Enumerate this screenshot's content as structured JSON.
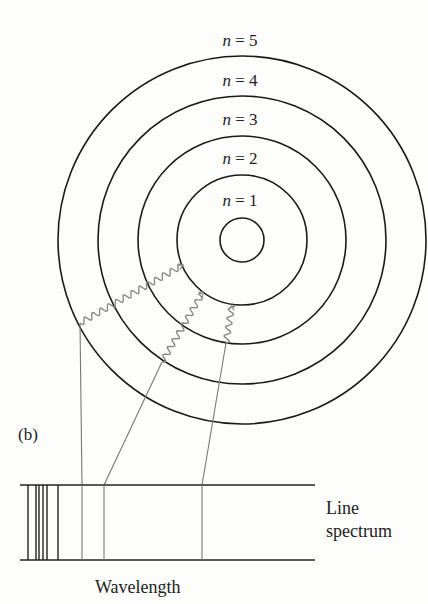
{
  "figure": {
    "panel_label": "(b)",
    "center": {
      "x": 242,
      "y": 240
    },
    "colors": {
      "orbit": "#1a1a1a",
      "photon": "#8a8a8a",
      "spectrum_dark": "#222222",
      "spectrum_gray": "#777777",
      "text": "#222222"
    },
    "orbits": [
      {
        "label": "n = 1",
        "r": 65,
        "label_y": 206
      },
      {
        "label": "n = 2",
        "r": 104,
        "label_y": 164
      },
      {
        "label": "n = 3",
        "r": 144,
        "label_y": 125
      },
      {
        "label": "n = 4",
        "r": 184,
        "label_y": 86
      },
      {
        "label": "n = 5",
        "r": null,
        "label_y": 46
      }
    ],
    "nucleus": {
      "r": 22
    },
    "spectrum": {
      "label_line1": "Line",
      "label_line2": "spectrum",
      "axis_label": "Wavelength",
      "box": {
        "x1": 20,
        "x2": 315,
        "y_top": 485,
        "y_bottom": 560
      },
      "dark_lines_x": [
        28,
        36,
        39,
        43,
        47,
        58
      ],
      "gray_lines_x": [
        82,
        104,
        202
      ]
    },
    "transitions": [
      {
        "from": "n = 4",
        "to": "n = 1",
        "wave_start": [
          80,
          323
        ],
        "wave_end": [
          183,
          265
        ],
        "line_bottom": [
          82,
          485
        ]
      },
      {
        "from": "n = 3",
        "to": "n = 1",
        "wave_start": [
          162,
          362
        ],
        "wave_end": [
          203,
          292
        ],
        "line_bottom": [
          104,
          485
        ]
      },
      {
        "from": "n = 2",
        "to": "n = 1",
        "wave_start": [
          226,
          343
        ],
        "wave_end": [
          232,
          305
        ],
        "line_bottom": [
          202,
          485
        ]
      }
    ]
  }
}
